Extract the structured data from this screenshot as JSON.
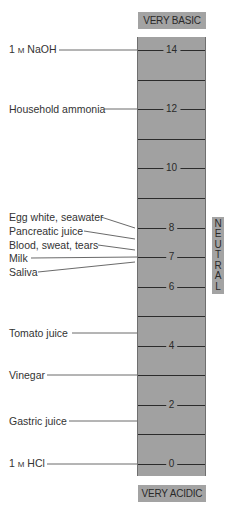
{
  "scale": {
    "top_label": "VERY BASIC",
    "bottom_label": "VERY ACIDIC",
    "neutral_label": "NEUTRAL",
    "tick_labels": [
      "14",
      "12",
      "10",
      "8",
      "7",
      "6",
      "4",
      "2",
      "0"
    ]
  },
  "substances": [
    {
      "name_pre": "1 ",
      "name_sc": "M",
      "name_post": " NaOH",
      "ph": 14
    },
    {
      "name": "Household ammonia",
      "ph": 12
    },
    {
      "name": "Egg white, seawater",
      "ph": 8
    },
    {
      "name": "Pancreatic juice",
      "ph": 7.6
    },
    {
      "name": "Blood, sweat, tears",
      "ph": 7.3
    },
    {
      "name": "Milk",
      "ph": 7.0
    },
    {
      "name": "Saliva",
      "ph": 6.8
    },
    {
      "name": "Tomato juice",
      "ph": 4.5
    },
    {
      "name": "Vinegar",
      "ph": 3.0
    },
    {
      "name": "Gastric juice",
      "ph": 1.5
    },
    {
      "name_pre": "1 ",
      "name_sc": "M",
      "name_post": " HCl",
      "ph": 0
    }
  ],
  "colors": {
    "column_fill": "#a1a1a1",
    "label_box": "#a3a3a3",
    "tick_line": "#2b2b2b"
  }
}
